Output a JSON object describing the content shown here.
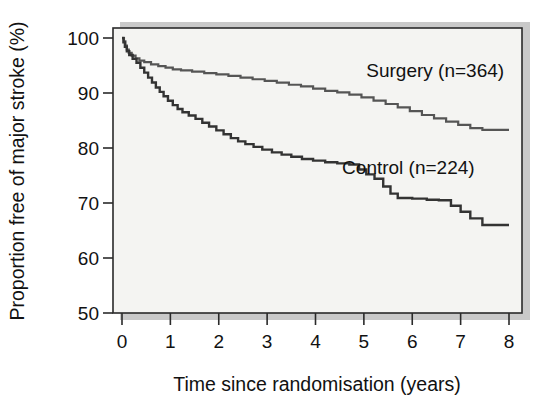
{
  "chart_data": {
    "type": "line",
    "title": "",
    "subtitle": "",
    "xlabel": "Time since randomisation (years)",
    "ylabel": "Proportion free of major stroke (%)",
    "xlim": [
      0,
      8
    ],
    "ylim": [
      50,
      100
    ],
    "xticks": [
      "0",
      "1",
      "2",
      "3",
      "4",
      "5",
      "6",
      "7",
      "8"
    ],
    "xtick_values": [
      0,
      1,
      2,
      3,
      4,
      5,
      6,
      7,
      8
    ],
    "yticks": [
      "50",
      "60",
      "70",
      "80",
      "90",
      "100"
    ],
    "ytick_values": [
      50,
      60,
      70,
      80,
      90,
      100
    ],
    "grid": false,
    "legend_position": "inline-annotation",
    "curve_style": "kaplan-meier-step",
    "series": [
      {
        "name": "Surgery",
        "label": "Surgery (n=364)",
        "n": 364,
        "color": "#555555",
        "label_x": 5.05,
        "label_y": 93.0,
        "points": [
          [
            0.0,
            100.0
          ],
          [
            0.04,
            99.4
          ],
          [
            0.07,
            98.6
          ],
          [
            0.1,
            97.9
          ],
          [
            0.14,
            97.3
          ],
          [
            0.2,
            96.8
          ],
          [
            0.28,
            96.3
          ],
          [
            0.36,
            95.9
          ],
          [
            0.46,
            95.6
          ],
          [
            0.6,
            95.2
          ],
          [
            0.75,
            94.9
          ],
          [
            0.9,
            94.6
          ],
          [
            1.05,
            94.3
          ],
          [
            1.22,
            94.1
          ],
          [
            1.45,
            93.9
          ],
          [
            1.7,
            93.6
          ],
          [
            1.95,
            93.4
          ],
          [
            2.2,
            93.1
          ],
          [
            2.45,
            92.8
          ],
          [
            2.7,
            92.5
          ],
          [
            2.95,
            92.2
          ],
          [
            3.2,
            91.9
          ],
          [
            3.45,
            91.5
          ],
          [
            3.7,
            91.2
          ],
          [
            3.95,
            90.8
          ],
          [
            4.2,
            90.4
          ],
          [
            4.45,
            90.1
          ],
          [
            4.7,
            89.7
          ],
          [
            4.95,
            89.2
          ],
          [
            5.2,
            88.6
          ],
          [
            5.45,
            88.0
          ],
          [
            5.7,
            87.4
          ],
          [
            5.95,
            86.7
          ],
          [
            6.2,
            86.0
          ],
          [
            6.45,
            85.4
          ],
          [
            6.7,
            84.8
          ],
          [
            6.95,
            84.2
          ],
          [
            7.2,
            83.6
          ],
          [
            7.45,
            83.3
          ],
          [
            8.0,
            83.3
          ]
        ]
      },
      {
        "name": "Control",
        "label": "Control (n=224)",
        "n": 224,
        "color": "#333333",
        "label_x": 4.55,
        "label_y": 75.2,
        "points": [
          [
            0.0,
            100.0
          ],
          [
            0.03,
            99.2
          ],
          [
            0.06,
            98.4
          ],
          [
            0.1,
            97.6
          ],
          [
            0.15,
            96.9
          ],
          [
            0.22,
            96.2
          ],
          [
            0.3,
            95.5
          ],
          [
            0.38,
            94.6
          ],
          [
            0.46,
            93.7
          ],
          [
            0.54,
            92.8
          ],
          [
            0.62,
            91.9
          ],
          [
            0.7,
            91.0
          ],
          [
            0.78,
            90.2
          ],
          [
            0.86,
            89.4
          ],
          [
            0.95,
            88.6
          ],
          [
            1.05,
            87.8
          ],
          [
            1.15,
            87.1
          ],
          [
            1.25,
            86.5
          ],
          [
            1.38,
            85.9
          ],
          [
            1.52,
            85.3
          ],
          [
            1.66,
            84.6
          ],
          [
            1.8,
            83.9
          ],
          [
            1.95,
            83.2
          ],
          [
            2.1,
            82.5
          ],
          [
            2.25,
            81.8
          ],
          [
            2.4,
            81.2
          ],
          [
            2.55,
            80.7
          ],
          [
            2.72,
            80.2
          ],
          [
            2.9,
            79.7
          ],
          [
            3.1,
            79.2
          ],
          [
            3.3,
            78.8
          ],
          [
            3.5,
            78.4
          ],
          [
            3.72,
            78.0
          ],
          [
            3.95,
            77.7
          ],
          [
            4.2,
            77.4
          ],
          [
            4.45,
            77.2
          ],
          [
            4.7,
            77.0
          ],
          [
            4.9,
            76.1
          ],
          [
            5.05,
            75.2
          ],
          [
            5.22,
            74.4
          ],
          [
            5.4,
            73.0
          ],
          [
            5.55,
            71.7
          ],
          [
            5.7,
            70.9
          ],
          [
            6.0,
            70.8
          ],
          [
            6.3,
            70.6
          ],
          [
            6.55,
            70.5
          ],
          [
            6.8,
            69.5
          ],
          [
            7.0,
            68.4
          ],
          [
            7.2,
            67.2
          ],
          [
            7.45,
            66.0
          ],
          [
            8.0,
            66.0
          ]
        ]
      }
    ]
  },
  "axes": {
    "ylabel": "Proportion free of major stroke (%)",
    "xlabel": "Time since randomisation (years)"
  }
}
